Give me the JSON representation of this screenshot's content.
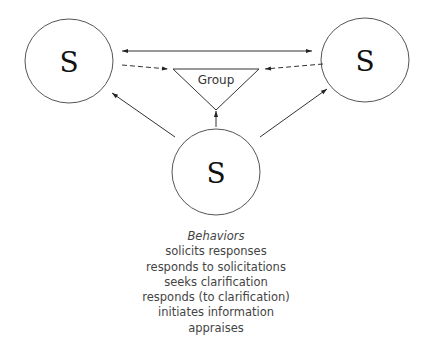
{
  "diagram": {
    "nodes": [
      {
        "id": "left",
        "label": "S"
      },
      {
        "id": "right",
        "label": "S"
      },
      {
        "id": "bottom",
        "label": "S"
      }
    ],
    "group": {
      "label": "Group"
    },
    "edges": [
      {
        "from": "left",
        "to": "right",
        "style": "solid",
        "direction": "both"
      },
      {
        "from": "left",
        "to": "group",
        "style": "dashed"
      },
      {
        "from": "right",
        "to": "group",
        "style": "dashed"
      },
      {
        "from": "bottom",
        "to": "left",
        "style": "solid"
      },
      {
        "from": "bottom",
        "to": "right",
        "style": "solid"
      },
      {
        "from": "bottom",
        "to": "group",
        "style": "solid"
      }
    ]
  },
  "behaviors": {
    "title": "Behaviors",
    "items": [
      "solicits responses",
      "responds to solicitations",
      "seeks clarification",
      "responds (to clarification)",
      "initiates information",
      "appraises"
    ]
  }
}
